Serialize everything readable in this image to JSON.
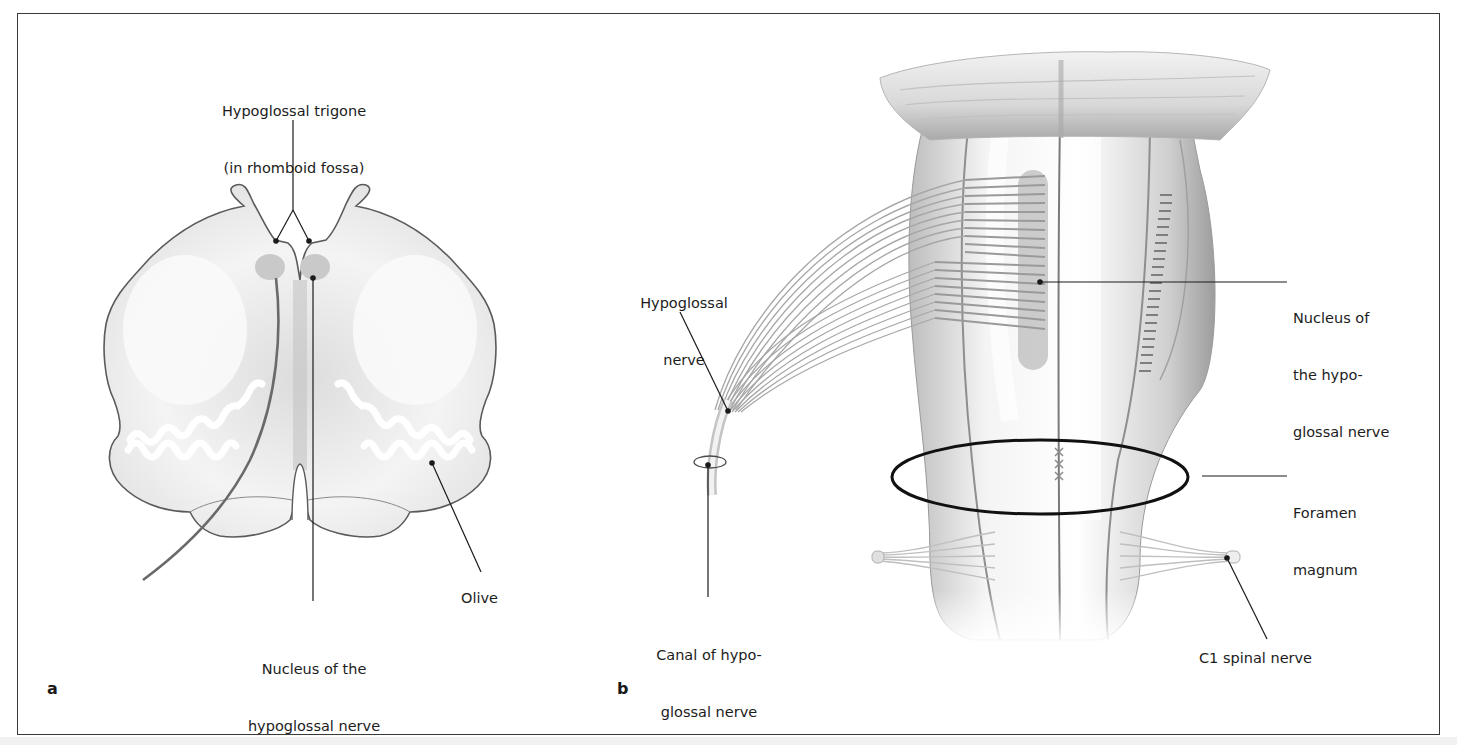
{
  "figure": {
    "panels": [
      {
        "letter": "a",
        "view": "cross-section of medulla oblongata",
        "labels": {
          "trigone_line1": "Hypoglossal trigone",
          "trigone_line2": "(in rhomboid fossa)",
          "nucleus_line1": "Nucleus of the",
          "nucleus_line2": "hypoglossal nerve",
          "olive": "Olive"
        }
      },
      {
        "letter": "b",
        "view": "anterior view of brainstem",
        "labels": {
          "nerve_line1": "Hypoglossal",
          "nerve_line2": "nerve",
          "nucleus_line1": "Nucleus of",
          "nucleus_line2": "the hypo-",
          "nucleus_line3": "glossal nerve",
          "foramen_line1": "Foramen",
          "foramen_line2": "magnum",
          "canal_line1": "Canal of hypo-",
          "canal_line2": "glossal nerve",
          "c1": "C1 spinal nerve"
        }
      }
    ],
    "colors": {
      "outline": "#555555",
      "nucleus_fill": "#c8c8c8",
      "leader": "#1a1a1a",
      "tissue": "#e9e9e9"
    }
  }
}
